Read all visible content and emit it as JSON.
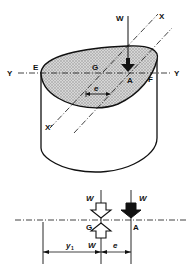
{
  "diagram": {
    "type": "engineering-eccentric-load",
    "upper": {
      "labels": {
        "W": "W",
        "X_top": "X",
        "X_bottom": "X'",
        "Y_left": "Y",
        "Y_right": "Y",
        "E": "E",
        "F": "F",
        "G": "G",
        "A": "A",
        "e": "e"
      }
    },
    "lower": {
      "labels": {
        "W_top_left": "W",
        "W_top_right": "W",
        "W_bottom": "W",
        "G": "G",
        "A": "A",
        "y1_main": "y",
        "y1_sub": "1",
        "e": "e"
      }
    },
    "colors": {
      "line": "#111111",
      "hatch": "#bdbdbd",
      "background": "#ffffff"
    }
  }
}
